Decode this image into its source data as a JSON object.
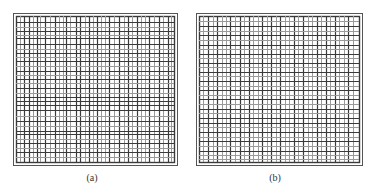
{
  "figures": [
    {
      "id": "a",
      "caption": "(a)",
      "outer": {
        "x": 13,
        "y": 13,
        "w": 164,
        "h": 152
      },
      "inner": {
        "x": 16,
        "y": 16,
        "w": 158,
        "h": 146
      },
      "vertical_lines": [
        20,
        24,
        29,
        33,
        37,
        40,
        45,
        50,
        55,
        59,
        63,
        66,
        70,
        76,
        80,
        85,
        89,
        93,
        97,
        101,
        105,
        109,
        114,
        119,
        124,
        128,
        132,
        137,
        141,
        145,
        149,
        154,
        159,
        163,
        168,
        171
      ],
      "vertical_dark": [
        24,
        29,
        37,
        45,
        55,
        66,
        76,
        80,
        89,
        97,
        109,
        119,
        128,
        137,
        149,
        159,
        168
      ],
      "horizontal_lines": [
        22,
        27,
        31,
        35,
        38,
        44,
        49,
        53,
        57,
        61,
        66,
        71,
        75,
        79,
        83,
        88,
        93,
        97,
        101,
        105,
        110,
        116,
        121,
        126,
        131,
        134,
        139,
        143,
        148,
        152,
        157
      ],
      "horizontal_dark": [
        22,
        31,
        38,
        44,
        53,
        61,
        71,
        79,
        88,
        97,
        101,
        105,
        110,
        121,
        131,
        134,
        143,
        152
      ],
      "caption_x": 92,
      "caption_y": 172
    },
    {
      "id": "b",
      "caption": "(b)",
      "outer": {
        "x": 196,
        "y": 13,
        "w": 166,
        "h": 152
      },
      "inner": {
        "x": 199,
        "y": 16,
        "w": 160,
        "h": 146
      },
      "vertical_lines": [
        203,
        208,
        213,
        217,
        222,
        226,
        230,
        235,
        240,
        244,
        249,
        253,
        258,
        262,
        267,
        271,
        276,
        280,
        285,
        289,
        294,
        298,
        303,
        308,
        312,
        317,
        321,
        326,
        330,
        335,
        339,
        344,
        348,
        353
      ],
      "vertical_dark": [
        208,
        217,
        230,
        240,
        249,
        262,
        271,
        280,
        294,
        303,
        317,
        326,
        335,
        348
      ],
      "horizontal_lines": [
        21,
        26,
        31,
        35,
        40,
        45,
        49,
        54,
        58,
        63,
        67,
        72,
        76,
        81,
        86,
        90,
        95,
        99,
        104,
        109,
        113,
        118,
        123,
        127,
        132,
        137,
        141,
        146,
        151,
        155,
        159
      ],
      "horizontal_dark": [
        26,
        35,
        45,
        54,
        63,
        72,
        81,
        90,
        99,
        109,
        118,
        123,
        132,
        141,
        151
      ],
      "caption_x": 275,
      "caption_y": 172
    }
  ],
  "colors": {
    "border": "#555555",
    "line_dark": "#3a3a3a",
    "line_light": "#9a9a9a",
    "background": "#ffffff"
  }
}
